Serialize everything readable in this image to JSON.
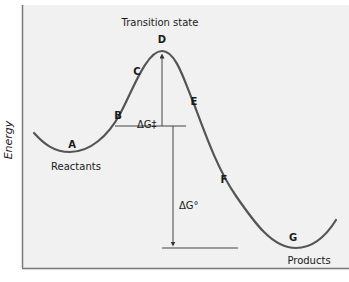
{
  "diagram": {
    "title_label": "Transition state",
    "y_axis_label": "Energy",
    "points": [
      {
        "id": "A",
        "label": "A"
      },
      {
        "id": "B",
        "label": "B"
      },
      {
        "id": "C",
        "label": "C"
      },
      {
        "id": "D",
        "label": "D"
      },
      {
        "id": "E",
        "label": "E"
      },
      {
        "id": "F",
        "label": "F"
      },
      {
        "id": "G",
        "label": "G"
      }
    ],
    "reactants_label": "Reactants",
    "products_label": "Products",
    "activation_energy_label": "ΔG‡",
    "standard_free_energy_label": "ΔG°",
    "colors": {
      "background": "#f1f1f1",
      "frame": "#7a7a7a",
      "curve": "#555555",
      "lines": "#444444",
      "text": "#1a1a1a"
    }
  }
}
